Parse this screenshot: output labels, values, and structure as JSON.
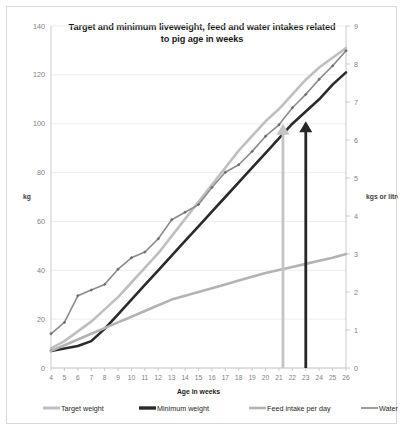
{
  "chart_data": {
    "type": "line",
    "title": "Target and minimum liveweight, feed and water intakes related to pig age in weeks",
    "title_line1": "Target and minimum liveweight, feed and water intakes related",
    "title_line2": "to pig age in weeks",
    "xlabel": "Age in weeks",
    "ylabel": "kg",
    "y2label": "kgs or litres/day",
    "x": [
      4,
      5,
      6,
      7,
      8,
      9,
      10,
      11,
      12,
      13,
      14,
      15,
      16,
      17,
      18,
      19,
      20,
      21,
      22,
      23,
      24,
      25,
      26
    ],
    "xlim": [
      4,
      26
    ],
    "ylim": [
      0,
      140
    ],
    "y2lim": [
      0,
      9
    ],
    "yticks": [
      0,
      20,
      40,
      60,
      80,
      100,
      120,
      140
    ],
    "y2ticks": [
      0,
      1,
      2,
      3,
      4,
      5,
      6,
      7,
      8,
      9
    ],
    "grid": true,
    "legend_position": "bottom",
    "series": [
      {
        "name": "Target weight",
        "axis": "left",
        "color": "#bfbfbf",
        "width": 2.6,
        "markers": false,
        "values": [
          8,
          11,
          15,
          19,
          24,
          29,
          35,
          41,
          47,
          54,
          61,
          68,
          75,
          82,
          89,
          95,
          101,
          106,
          112,
          118,
          123,
          127,
          131
        ]
      },
      {
        "name": "Minimum weight",
        "axis": "left",
        "color": "#2b2b2b",
        "width": 2.6,
        "markers": false,
        "values": [
          7,
          8,
          9,
          11,
          16,
          22,
          28,
          34,
          40,
          46,
          52,
          58,
          64,
          70,
          76,
          82,
          88,
          94,
          100,
          105,
          110,
          116,
          121
        ]
      },
      {
        "name": "Feed intake per day",
        "axis": "right",
        "color": "#b3b3b3",
        "width": 2.6,
        "markers": false,
        "values": [
          0.45,
          0.6,
          0.75,
          0.9,
          1.05,
          1.2,
          1.35,
          1.5,
          1.65,
          1.8,
          1.9,
          2.0,
          2.1,
          2.2,
          2.3,
          2.4,
          2.5,
          2.58,
          2.66,
          2.74,
          2.82,
          2.9,
          3.0
        ]
      },
      {
        "name": "Water intake per day",
        "axis": "right",
        "color": "#8c8c8c",
        "width": 1.6,
        "markers": true,
        "values": [
          0.9,
          1.2,
          1.9,
          2.05,
          2.2,
          2.6,
          2.9,
          3.05,
          3.4,
          3.9,
          4.1,
          4.3,
          4.75,
          5.15,
          5.35,
          5.7,
          6.1,
          6.4,
          6.85,
          7.2,
          7.6,
          7.95,
          8.35
        ]
      }
    ],
    "annotations": [
      {
        "name": "target-weight-arrow",
        "type": "arrow",
        "color": "#c4c4c4",
        "x": 21.3,
        "y_from": 0,
        "y_to": 100,
        "axis": "left"
      },
      {
        "name": "minimum-weight-arrow",
        "type": "arrow",
        "color": "#262626",
        "x": 23.0,
        "y_from": 0,
        "y_to": 101,
        "axis": "left"
      }
    ],
    "legend": [
      {
        "label": "Target weight",
        "color": "#bfbfbf",
        "width": 3
      },
      {
        "label": "Minimum weight",
        "color": "#2b2b2b",
        "width": 3.4
      },
      {
        "label": "Feed intake per day",
        "color": "#b3b3b3",
        "width": 2.6
      },
      {
        "label": "Water intake per day",
        "color": "#9e9e9e",
        "width": 2
      }
    ]
  }
}
